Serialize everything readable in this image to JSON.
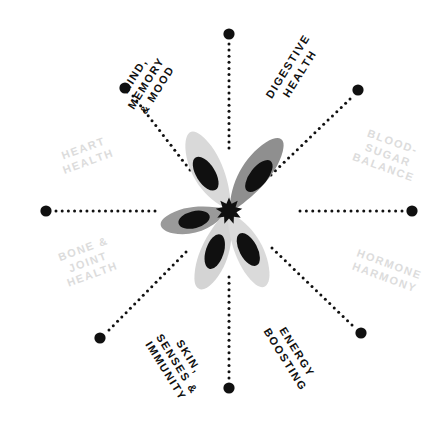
{
  "diagram": {
    "type": "radial-benefits-wheel",
    "title": "",
    "center_icon": "five-petal-flower-icon",
    "colors": {
      "background": "#ffffff",
      "label_active": "#101010",
      "label_inactive": "#dcdcdc",
      "node_dot": "#101010",
      "connector_dot": "#101010",
      "petal_light": "#d9d9d9",
      "petal_mid": "#9a9a9a",
      "petal_dark": "#6e6e6e",
      "petal_inner": "#101010",
      "center_burst": "#101010"
    },
    "spoke_count": 8,
    "labels": [
      {
        "id": "mind-memory-mood",
        "text": "MIND,\nMEMORY\n& MOOD",
        "state": "active",
        "x": 146,
        "y": 83,
        "rotate": -58,
        "font_size": 11
      },
      {
        "id": "digestive-health",
        "text": "DIGESTIVE\nHEALTH",
        "state": "active",
        "x": 294,
        "y": 70,
        "rotate": -58,
        "font_size": 11
      },
      {
        "id": "blood-sugar-balance",
        "text": "BLOOD-\nSUGAR\nBALANCE",
        "state": "inactive",
        "x": 388,
        "y": 155,
        "rotate": 20,
        "font_size": 11
      },
      {
        "id": "hormone-harmony",
        "text": "HORMONE\nHARMONY",
        "state": "inactive",
        "x": 387,
        "y": 271,
        "rotate": 20,
        "font_size": 11
      },
      {
        "id": "energy-boosting",
        "text": "ENERGY\nBOOSTING",
        "state": "active",
        "x": 291,
        "y": 356,
        "rotate": 58,
        "font_size": 11
      },
      {
        "id": "skin-senses-immunity",
        "text": "SKIN,\nSENSES &\nIMMUNITY",
        "state": "active",
        "x": 177,
        "y": 364,
        "rotate": 58,
        "font_size": 11
      },
      {
        "id": "bone-joint-health",
        "text": "BONE &\nJOINT\nHEALTH",
        "state": "inactive",
        "x": 88,
        "y": 262,
        "rotate": -20,
        "font_size": 11
      },
      {
        "id": "heart-health",
        "text": "HEART\nHEALTH",
        "state": "inactive",
        "x": 86,
        "y": 155,
        "rotate": -20,
        "font_size": 11
      }
    ],
    "spokes": [
      {
        "id": "spoke-north",
        "x1": 229,
        "y1": 44,
        "x2": 229,
        "y2": 148,
        "node_x": 229,
        "node_y": 34,
        "node_r": 5.6
      },
      {
        "id": "spoke-northeast",
        "x1": 350,
        "y1": 99,
        "x2": 271,
        "y2": 175,
        "node_x": 358,
        "node_y": 90,
        "node_r": 5.6
      },
      {
        "id": "spoke-east",
        "x1": 402,
        "y1": 211,
        "x2": 300,
        "y2": 211,
        "node_x": 412,
        "node_y": 211,
        "node_r": 5.6
      },
      {
        "id": "spoke-southeast",
        "x1": 352,
        "y1": 325,
        "x2": 272,
        "y2": 248,
        "node_x": 361,
        "node_y": 333,
        "node_r": 5.6
      },
      {
        "id": "spoke-south",
        "x1": 229,
        "y1": 378,
        "x2": 229,
        "y2": 277,
        "node_x": 229,
        "node_y": 388,
        "node_r": 5.6
      },
      {
        "id": "spoke-southwest",
        "x1": 109,
        "y1": 330,
        "x2": 186,
        "y2": 252,
        "node_x": 100,
        "node_y": 338,
        "node_r": 5.6
      },
      {
        "id": "spoke-west",
        "x1": 56,
        "y1": 211,
        "x2": 155,
        "y2": 211,
        "node_x": 46,
        "node_y": 211,
        "node_r": 5.6
      },
      {
        "id": "spoke-northwest",
        "x1": 133,
        "y1": 96,
        "x2": 190,
        "y2": 170,
        "node_x": 125,
        "node_y": 88,
        "node_r": 5.6
      }
    ]
  }
}
